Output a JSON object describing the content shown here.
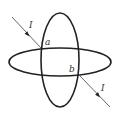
{
  "diagram": {
    "colors": {
      "ring": "#222222",
      "wire": "#555555",
      "text": "#333333",
      "background": "#ffffff"
    },
    "rings": [
      {
        "name": "vertical-ring",
        "cx": 60,
        "cy": 60,
        "rx": 19,
        "ry": 47
      },
      {
        "name": "horizontal-ring",
        "cx": 60,
        "cy": 62,
        "rx": 51,
        "ry": 14
      }
    ],
    "points": {
      "a": {
        "label": "a",
        "x": 41,
        "y": 48
      },
      "b": {
        "label": "b",
        "x": 79,
        "y": 75
      }
    },
    "wires": {
      "incoming": {
        "label": "I",
        "from": [
          12,
          17
        ],
        "to": [
          41,
          48
        ]
      },
      "outgoing": {
        "label": "I",
        "from": [
          79,
          75
        ],
        "to": [
          110,
          107
        ]
      }
    }
  }
}
